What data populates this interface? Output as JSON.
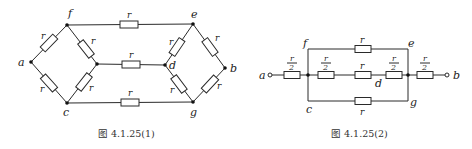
{
  "figure1": {
    "caption": "图 4.1.25(1)",
    "nodes": {
      "a": "a",
      "b": "b",
      "c": "c",
      "d": "d",
      "e": "e",
      "f": "f",
      "g": "g"
    },
    "resistor_label": "r",
    "resistors": [
      {
        "from": "a",
        "to": "f",
        "value": "r"
      },
      {
        "from": "a",
        "to": "c",
        "value": "r"
      },
      {
        "from": "f",
        "to": "center",
        "value": "r"
      },
      {
        "from": "c",
        "to": "center",
        "value": "r"
      },
      {
        "from": "f",
        "to": "e",
        "value": "r"
      },
      {
        "from": "center",
        "to": "d",
        "value": "r"
      },
      {
        "from": "c",
        "to": "g",
        "value": "r"
      },
      {
        "from": "e",
        "to": "d",
        "value": "r"
      },
      {
        "from": "d",
        "to": "g",
        "value": "r"
      },
      {
        "from": "e",
        "to": "b",
        "value": "r"
      },
      {
        "from": "g",
        "to": "b",
        "value": "r"
      }
    ]
  },
  "figure2": {
    "caption": "图 4.1.25(2)",
    "nodes": {
      "a": "a",
      "b": "b",
      "c": "c",
      "d": "d",
      "e": "e",
      "f": "f",
      "g": "g"
    },
    "half_numerator": "r",
    "half_denominator": "2",
    "resistor_label": "r",
    "resistors": [
      {
        "branch": "a-input",
        "value": "r/2"
      },
      {
        "branch": "top f-e",
        "value": "r"
      },
      {
        "branch": "middle-1",
        "value": "r/2"
      },
      {
        "branch": "middle-2",
        "value": "r"
      },
      {
        "branch": "middle-3",
        "value": "r/2"
      },
      {
        "branch": "bottom c-g",
        "value": "r"
      },
      {
        "branch": "b-output",
        "value": "r/2"
      }
    ]
  }
}
